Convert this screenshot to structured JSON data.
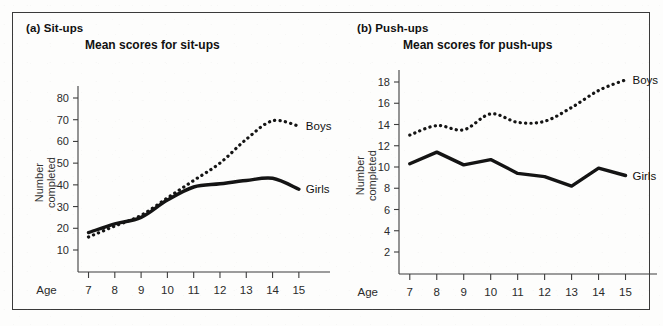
{
  "figure": {
    "background_color": "#fdfdfc",
    "border_color": "#3a3a3a",
    "line_color": "#141414"
  },
  "panels": [
    {
      "id": "a",
      "label": "(a) Sit-ups",
      "title": "Mean scores for sit-ups",
      "ylabel_line1": "Number",
      "ylabel_line2": "completed",
      "xlabel": "Age",
      "series_labels": {
        "boys": "Boys",
        "girls": "Girls"
      }
    },
    {
      "id": "b",
      "label": "(b) Push-ups",
      "title": "Mean scores for push-ups",
      "ylabel_line1": "Number",
      "ylabel_line2": "completed",
      "xlabel": "Age",
      "series_labels": {
        "boys": "Boys",
        "girls": "Girls"
      }
    }
  ],
  "chart_data": [
    {
      "type": "line",
      "title": "Mean scores for sit-ups",
      "panel": "(a) Sit-ups",
      "xlabel": "Age",
      "ylabel": "Number completed",
      "x": [
        7,
        8,
        9,
        10,
        11,
        12,
        13,
        14,
        15
      ],
      "xticklabels": [
        "7",
        "8",
        "9",
        "10",
        "11",
        "12",
        "13",
        "14",
        "15"
      ],
      "yticklabels": [
        "10",
        "20",
        "30",
        "40",
        "50",
        "60",
        "70",
        "80"
      ],
      "ylim": [
        5,
        85
      ],
      "xlim": [
        6.6,
        15.5
      ],
      "grid": false,
      "legend": "inline-right",
      "series": [
        {
          "name": "Boys",
          "style": "dotted",
          "values": [
            16,
            21,
            26,
            34,
            42,
            50,
            61,
            69.5,
            67
          ]
        },
        {
          "name": "Girls",
          "style": "solid",
          "values": [
            18,
            22,
            25,
            33,
            39,
            40.5,
            42,
            43,
            38
          ]
        }
      ]
    },
    {
      "type": "line",
      "title": "Mean scores for push-ups",
      "panel": "(b) Push-ups",
      "xlabel": "Age",
      "ylabel": "Number completed",
      "x": [
        7,
        8,
        9,
        10,
        11,
        12,
        13,
        14,
        15
      ],
      "xticklabels": [
        "7",
        "8",
        "9",
        "10",
        "11",
        "12",
        "13",
        "14",
        "15"
      ],
      "yticklabels": [
        "2",
        "4",
        "6",
        "8",
        "10",
        "12",
        "14",
        "16",
        "18"
      ],
      "ylim": [
        1,
        19
      ],
      "xlim": [
        6.6,
        15.5
      ],
      "grid": false,
      "legend": "inline-right",
      "series": [
        {
          "name": "Boys",
          "style": "dotted",
          "values": [
            13.0,
            13.9,
            13.5,
            15.0,
            14.2,
            14.3,
            15.6,
            17.2,
            18.2
          ]
        },
        {
          "name": "Girls",
          "style": "solid",
          "values": [
            10.3,
            11.4,
            10.2,
            10.7,
            9.4,
            9.1,
            8.2,
            9.9,
            9.2
          ]
        }
      ]
    }
  ]
}
